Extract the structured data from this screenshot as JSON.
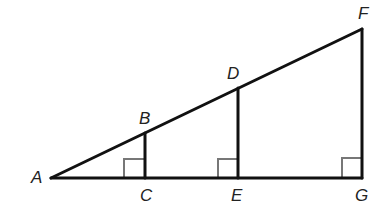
{
  "diagram": {
    "type": "similar right triangles",
    "points": {
      "A": {
        "label": "A",
        "x": 51,
        "y": 178
      },
      "B": {
        "label": "B",
        "x": 145,
        "y": 133
      },
      "C": {
        "label": "C",
        "x": 145,
        "y": 178
      },
      "D": {
        "label": "D",
        "x": 238,
        "y": 88
      },
      "E": {
        "label": "E",
        "x": 238,
        "y": 178
      },
      "F": {
        "label": "F",
        "x": 362,
        "y": 29
      },
      "G": {
        "label": "G",
        "x": 362,
        "y": 178
      }
    },
    "segments": [
      "AF",
      "AG",
      "BC",
      "DE",
      "FG"
    ],
    "right_angles": [
      "C",
      "E",
      "G"
    ],
    "colors": {
      "line": "#111111",
      "right_angle_mark": "#777777",
      "label": "#222222"
    }
  }
}
